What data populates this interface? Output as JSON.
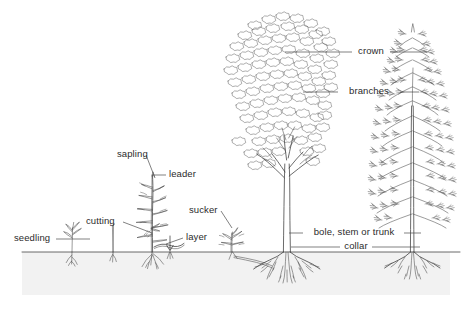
{
  "diagram": {
    "type": "botanical-line-diagram",
    "background_color": "#ffffff",
    "ink_color": "#3a3a3a",
    "soil_color": "#f2f2f2",
    "ground_line_y": 252,
    "labels": [
      {
        "id": "seedling",
        "text": "seedling",
        "x": 14,
        "y": 234,
        "align": "left",
        "leader": {
          "from": [
            58,
            239
          ],
          "to": [
            90,
            239
          ]
        }
      },
      {
        "id": "cutting",
        "text": "cutting",
        "x": 86,
        "y": 217,
        "align": "left",
        "leader": {
          "from": [
            124,
            222
          ],
          "to": [
            152,
            233
          ]
        }
      },
      {
        "id": "sapling",
        "text": "sapling",
        "x": 117,
        "y": 150,
        "align": "left",
        "leader": {
          "from": [
            146,
            157
          ],
          "to": [
            155,
            176
          ]
        }
      },
      {
        "id": "leader",
        "text": "leader",
        "x": 168,
        "y": 170,
        "align": "left",
        "leader": {
          "from": [
            166,
            175
          ],
          "to": [
            152,
            175
          ]
        }
      },
      {
        "id": "layer",
        "text": "layer",
        "x": 185,
        "y": 233,
        "align": "left",
        "leader": {
          "from": [
            183,
            238
          ],
          "to": [
            163,
            243
          ]
        }
      },
      {
        "id": "sucker",
        "text": "sucker",
        "x": 190,
        "y": 206,
        "align": "left",
        "leader": {
          "from": [
            222,
            212
          ],
          "to": [
            232,
            226
          ]
        }
      },
      {
        "id": "crown",
        "text": "crown",
        "x": 370,
        "y": 47,
        "align": "center",
        "leader": {
          "from": [
            355,
            52
          ],
          "to": [
            285,
            52
          ],
          "from2": [
            388,
            52
          ],
          "to2": [
            425,
            52
          ]
        }
      },
      {
        "id": "branches",
        "text": "branches",
        "x": 368,
        "y": 86,
        "align": "center",
        "leader": {
          "from": [
            340,
            92
          ],
          "to": [
            305,
            92
          ],
          "from2": [
            398,
            92
          ],
          "to2": [
            420,
            92
          ]
        }
      },
      {
        "id": "bole",
        "text": "bole, stem or trunk",
        "x": 355,
        "y": 228,
        "align": "center",
        "leader": {
          "from": [
            308,
            233
          ],
          "to": [
            290,
            233
          ],
          "from2": [
            402,
            233
          ],
          "to2": [
            419,
            233
          ]
        }
      },
      {
        "id": "collar",
        "text": "collar",
        "x": 355,
        "y": 242,
        "align": "center",
        "leader": {
          "from": [
            342,
            247
          ],
          "to": [
            292,
            247
          ],
          "from2": [
            370,
            247
          ],
          "to2": [
            418,
            247
          ]
        }
      }
    ],
    "plants": [
      {
        "id": "seedling-plant",
        "name": "seedling",
        "x": 72,
        "label": "seedling"
      },
      {
        "id": "cutting-stick",
        "name": "cutting",
        "x": 113,
        "label": "cutting"
      },
      {
        "id": "sapling-plant",
        "name": "sapling",
        "x": 152,
        "label": "sapling"
      },
      {
        "id": "layer-shoot",
        "name": "layer",
        "x": 163,
        "label": "layer"
      },
      {
        "id": "sucker-shoot",
        "name": "sucker",
        "x": 232,
        "label": "sucker"
      },
      {
        "id": "deciduous-tree",
        "name": "broadleaf tree",
        "x": 287,
        "label": "bole, stem or trunk"
      },
      {
        "id": "conifer-tree",
        "name": "conifer tree",
        "x": 412,
        "label": "crown"
      }
    ]
  }
}
